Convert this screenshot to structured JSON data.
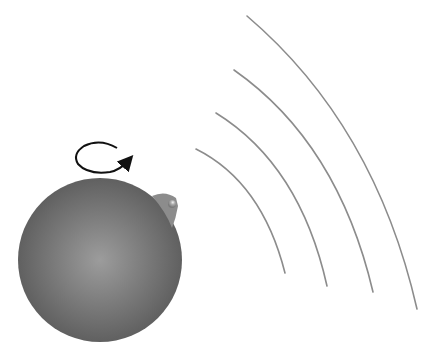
{
  "diagram": {
    "colors": {
      "background": "#ffffff",
      "sphere_center": "#9a9a9a",
      "sphere_edge": "#555555",
      "arc_stroke": "#8c8c8c",
      "arrow_stroke": "#111111",
      "hotspot": "#8a8a8a"
    },
    "sphere": {
      "cx": 100,
      "cy": 260,
      "r": 82
    },
    "rotation_arrow": {
      "icon": "rotation-arrow-icon",
      "direction": "counterclockwise-top-view"
    },
    "hotspot": {
      "x": 172,
      "y": 203
    },
    "arcs": [
      {
        "start": [
          196,
          149
        ],
        "end": [
          285,
          273
        ]
      },
      {
        "start": [
          216,
          113
        ],
        "end": [
          327,
          286
        ]
      },
      {
        "start": [
          234,
          70
        ],
        "end": [
          373,
          292
        ]
      },
      {
        "start": [
          247,
          16
        ],
        "end": [
          417,
          309
        ]
      }
    ]
  }
}
